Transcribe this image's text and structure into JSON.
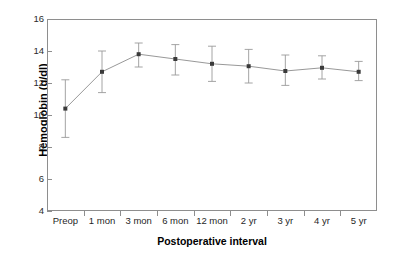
{
  "chart_data": {
    "type": "line",
    "title": "",
    "xlabel": "Postoperative interval",
    "ylabel": "Hemoglobin (g/dl)",
    "categories": [
      "Preop",
      "1 mon",
      "3 mon",
      "6 mon",
      "12 mon",
      "2 yr",
      "3 yr",
      "4 yr",
      "5 yr"
    ],
    "values": [
      10.4,
      12.7,
      13.8,
      13.5,
      13.2,
      13.05,
      12.75,
      12.95,
      12.7
    ],
    "error_low": [
      8.6,
      11.4,
      13.0,
      12.5,
      12.1,
      12.0,
      11.85,
      12.25,
      12.15
    ],
    "error_high": [
      12.2,
      14.0,
      14.5,
      14.4,
      14.3,
      14.1,
      13.75,
      13.7,
      13.35
    ],
    "ylim": [
      4,
      16
    ],
    "yticks": [
      4,
      6,
      8,
      10,
      12,
      14,
      16
    ],
    "ytick_labels": [
      "4",
      "6",
      "8",
      "10",
      "12",
      "14",
      "16"
    ],
    "grid": false,
    "legend": "none",
    "marker": "square",
    "error_bars": true,
    "series": [
      {
        "name": "Hemoglobin",
        "values": [
          10.4,
          12.7,
          13.8,
          13.5,
          13.2,
          13.05,
          12.75,
          12.95,
          12.7
        ]
      }
    ]
  },
  "style": {
    "line_color": "#8c8c8c",
    "marker_color": "#3a3a3a",
    "error_color": "#9a9a9a",
    "axis_color": "#8e8e8e",
    "text_color": "#000000",
    "background": "#ffffff"
  }
}
